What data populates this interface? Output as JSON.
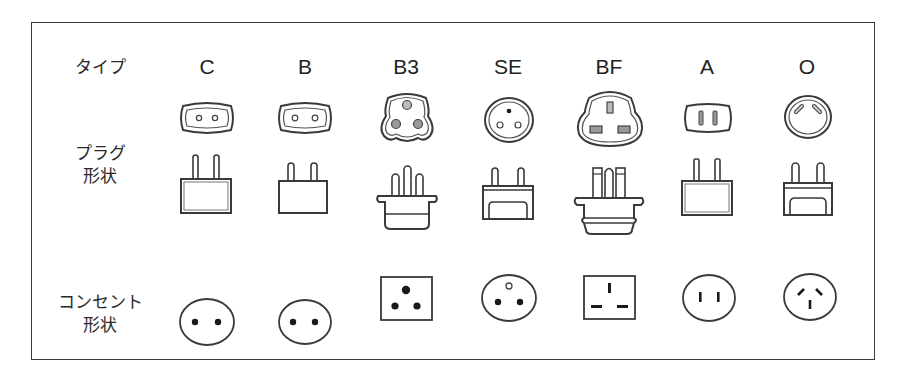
{
  "row_labels": {
    "type": "タイプ",
    "plug_line1": "プラグ",
    "plug_line2": "形状",
    "outlet_line1": "コンセント",
    "outlet_line2": "形状"
  },
  "types": [
    {
      "label": "C",
      "plug_face": "oval-2-round-pins",
      "plug_side": "2-pin-square-body",
      "outlet": "round-2-round-holes"
    },
    {
      "label": "B",
      "plug_face": "oval-2-round-pins",
      "plug_side": "2-pin-square-body",
      "outlet": "round-2-round-holes"
    },
    {
      "label": "B3",
      "plug_face": "3-round-pins-shaped",
      "plug_side": "3-pin-flanged-body",
      "outlet": "square-3-round-holes"
    },
    {
      "label": "SE",
      "plug_face": "round-3-pins",
      "plug_side": "2-pin-grounded-body",
      "outlet": "round-3-holes-earth-top"
    },
    {
      "label": "BF",
      "plug_face": "3-rect-pins-shaped",
      "plug_side": "3-pin-flanged-body",
      "outlet": "square-3-rect-holes"
    },
    {
      "label": "A",
      "plug_face": "oval-2-flat-pins",
      "plug_side": "2-pin-square-body",
      "outlet": "round-2-vertical-slots"
    },
    {
      "label": "O",
      "plug_face": "round-2-angled-pins",
      "plug_side": "2-pin-grounded-body",
      "outlet": "round-3-angled-slots"
    }
  ],
  "colors": {
    "stroke": "#3a3a3a",
    "fill": "#ffffff",
    "dot": "#1a1a1a"
  }
}
